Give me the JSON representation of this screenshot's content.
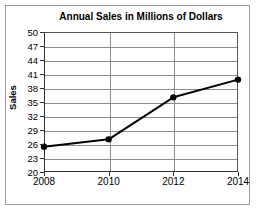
{
  "chart_data": {
    "type": "line",
    "title": "Annual Sales in Millions of Dollars",
    "xlabel": "",
    "ylabel": "Sales",
    "categories": [
      "2008",
      "2010",
      "2012",
      "2014"
    ],
    "x": [
      2008,
      2010,
      2012,
      2014
    ],
    "values": [
      25.4,
      27.0,
      36.0,
      39.8
    ],
    "series": [
      {
        "name": "Sales",
        "values": [
          25.4,
          27.0,
          36.0,
          39.8
        ]
      }
    ],
    "ylim": [
      20,
      50
    ],
    "yticks": [
      20,
      23,
      26,
      29,
      32,
      35,
      38,
      41,
      44,
      47,
      50
    ],
    "ytick_labels": [
      "20",
      "23",
      "26",
      "29",
      "32",
      "35",
      "38",
      "41",
      "44",
      "47",
      "50"
    ],
    "xtick_labels": [
      "2008",
      "2010",
      "2012",
      "2014"
    ],
    "grid": "horizontal-and-vertical",
    "legend": "none",
    "line_color": "#000000",
    "marker": "circle",
    "marker_color": "#000000",
    "grid_color": "#8c8c8c",
    "axis_color": "#333333",
    "background": "#ffffff"
  },
  "figure": {
    "title": "Annual Sales in Millions of Dollars",
    "y_axis_title": "Sales"
  }
}
